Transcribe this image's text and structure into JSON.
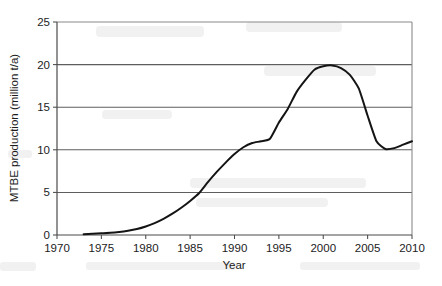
{
  "chart_data": {
    "type": "line",
    "title": "",
    "xlabel": "Year",
    "ylabel": "MTBE production (million t/a)",
    "xlim": [
      1970,
      2010
    ],
    "ylim": [
      0,
      25
    ],
    "xticks": [
      1970,
      1975,
      1980,
      1985,
      1990,
      1995,
      2000,
      2005,
      2010
    ],
    "yticks": [
      0,
      5,
      10,
      15,
      20,
      25
    ],
    "grid": "horizontal",
    "legend": "none",
    "series": [
      {
        "name": "MTBE production",
        "color": "#141414",
        "x": [
          1973,
          1974,
          1975,
          1976,
          1977,
          1978,
          1979,
          1980,
          1981,
          1982,
          1983,
          1984,
          1985,
          1986,
          1987,
          1988,
          1989,
          1990,
          1991,
          1992,
          1993,
          1994,
          1995,
          1996,
          1997,
          1998,
          1999,
          2000,
          2001,
          2002,
          2003,
          2004,
          2005,
          2006,
          2007,
          2008,
          2009,
          2010
        ],
        "values": [
          0.1,
          0.15,
          0.2,
          0.25,
          0.35,
          0.5,
          0.7,
          1.0,
          1.4,
          1.9,
          2.5,
          3.2,
          4.0,
          4.9,
          6.2,
          7.4,
          8.5,
          9.5,
          10.3,
          10.8,
          11.0,
          11.3,
          13.2,
          14.8,
          16.8,
          18.2,
          19.4,
          19.8,
          19.9,
          19.6,
          18.8,
          17.2,
          14.0,
          11.0,
          10.1,
          10.2,
          10.6,
          11.0
        ]
      }
    ]
  },
  "axis": {
    "y_tick_labels": [
      "0",
      "5",
      "10",
      "15",
      "20",
      "25"
    ],
    "x_tick_labels": [
      "1970",
      "1975",
      "1980",
      "1985",
      "1990",
      "1995",
      "2000",
      "2005",
      "2010"
    ],
    "x_title": "Year",
    "y_title": "MTBE production (million t/a)"
  }
}
